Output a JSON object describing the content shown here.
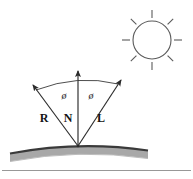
{
  "figure": {
    "background_color": "#ffffff",
    "stroke_color": "#333333",
    "label_color": "#141414",
    "surface": {
      "top_edge_color": "#3a3a3a",
      "fill_color": "#a8a8a8",
      "shadow_color": "#c9c9c9",
      "name": "curved-surface"
    },
    "baseline": {
      "color": "#8c8c8c",
      "name": "baseline-rule"
    },
    "sun": {
      "name": "sun-icon",
      "center_x": 152,
      "center_y": 40,
      "radius": 19,
      "ray_count": 8,
      "ray_inner": 22,
      "ray_outer": 30,
      "stroke_color": "#5a5a5a"
    },
    "origin": {
      "x": 78,
      "y": 146
    },
    "vectors": [
      {
        "name": "reflection-vector",
        "label": "R",
        "label_x": 44,
        "label_y": 122,
        "tip_x": 31,
        "tip_y": 83
      },
      {
        "name": "normal-vector",
        "label": "N",
        "label_x": 68,
        "label_y": 122,
        "tip_x": 78,
        "tip_y": 69
      },
      {
        "name": "light-vector",
        "label": "L",
        "label_x": 101,
        "label_y": 122,
        "tip_x": 123,
        "tip_y": 78
      }
    ],
    "angles": [
      {
        "name": "angle-phi-left",
        "label": "ø",
        "x": 64,
        "y": 99
      },
      {
        "name": "angle-phi-right",
        "label": "ø",
        "x": 91,
        "y": 99
      }
    ]
  }
}
